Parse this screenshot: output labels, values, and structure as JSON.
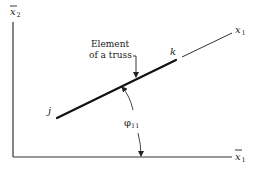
{
  "diagram": {
    "type": "truss-element-orientation",
    "axes": {
      "horizontal": {
        "label": "x",
        "subscript": "1",
        "overbar": true
      },
      "vertical": {
        "label": "x",
        "subscript": "2",
        "overbar": true
      }
    },
    "local_axis": {
      "label": "x",
      "subscript": "1",
      "overbar": false
    },
    "element": {
      "caption_line1": "Element",
      "caption_line2": "of a truss",
      "start_node": "j",
      "end_node": "k"
    },
    "angle": {
      "symbol": "φ",
      "subscript": "11"
    }
  },
  "colors": {
    "ink": "#222222",
    "background": "#ffffff"
  }
}
